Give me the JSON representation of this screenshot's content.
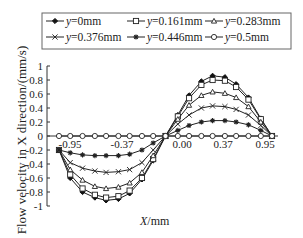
{
  "chart_data": {
    "type": "line",
    "title": "",
    "xlabel": "X/mm",
    "ylabel": "Flow velocity in X direction/(mm/s)",
    "ylim": [
      -1,
      1
    ],
    "xlim": [
      -0.95,
      0.95
    ],
    "yticks": [
      "1",
      "0.8",
      "0.6",
      "0.4",
      "0.2",
      "0",
      "-0.2",
      "-0.4",
      "-0.6",
      "-0.8",
      "-1"
    ],
    "xtick_labels": [
      "-0.95",
      "-0.37",
      "0.00",
      "0.37",
      "0.95"
    ],
    "grid": false,
    "legend_position": "top",
    "x": [
      -0.95,
      -0.85,
      -0.74,
      -0.63,
      -0.53,
      -0.42,
      -0.32,
      -0.21,
      -0.11,
      0.0,
      0.11,
      0.21,
      0.32,
      0.42,
      0.53,
      0.63,
      0.74,
      0.85,
      0.95
    ],
    "series": [
      {
        "name": "y=0mm",
        "marker": "filled-diamond",
        "values": [
          -0.2,
          -0.6,
          -0.8,
          -0.88,
          -0.92,
          -0.9,
          -0.82,
          -0.62,
          -0.35,
          0.0,
          0.3,
          0.58,
          0.78,
          0.86,
          0.84,
          0.74,
          0.55,
          0.25,
          0.0
        ]
      },
      {
        "name": "y=0.161mm",
        "marker": "open-square",
        "values": [
          -0.2,
          -0.55,
          -0.75,
          -0.84,
          -0.88,
          -0.86,
          -0.78,
          -0.6,
          -0.33,
          0.0,
          0.28,
          0.54,
          0.73,
          0.8,
          0.79,
          0.7,
          0.52,
          0.24,
          0.0
        ]
      },
      {
        "name": "y=0.283mm",
        "marker": "open-triangle",
        "values": [
          -0.2,
          -0.48,
          -0.63,
          -0.72,
          -0.75,
          -0.73,
          -0.67,
          -0.52,
          -0.28,
          0.0,
          0.24,
          0.44,
          0.58,
          0.63,
          0.61,
          0.55,
          0.42,
          0.2,
          0.0
        ]
      },
      {
        "name": "y=0.376mm",
        "marker": "x",
        "values": [
          -0.2,
          -0.38,
          -0.46,
          -0.5,
          -0.52,
          -0.51,
          -0.48,
          -0.38,
          -0.2,
          0.0,
          0.17,
          0.3,
          0.4,
          0.43,
          0.42,
          0.38,
          0.3,
          0.15,
          0.0
        ]
      },
      {
        "name": "y=0.446mm",
        "marker": "asterisk",
        "values": [
          -0.2,
          -0.24,
          -0.27,
          -0.28,
          -0.28,
          -0.28,
          -0.26,
          -0.2,
          -0.1,
          0.0,
          0.08,
          0.15,
          0.2,
          0.22,
          0.22,
          0.2,
          0.16,
          0.08,
          0.0
        ]
      },
      {
        "name": "y=0.5mm",
        "marker": "open-circle",
        "values": [
          0.0,
          0.0,
          0.0,
          0.0,
          0.0,
          0.0,
          0.0,
          0.0,
          0.0,
          0.0,
          0.0,
          0.0,
          0.0,
          0.0,
          0.0,
          0.0,
          0.0,
          0.0,
          0.0
        ]
      }
    ]
  },
  "legend": {
    "items": [
      {
        "label_var": "y",
        "label_rest": "=0mm"
      },
      {
        "label_var": "y",
        "label_rest": "=0.161mm"
      },
      {
        "label_var": "y",
        "label_rest": "=0.283mm"
      },
      {
        "label_var": "y",
        "label_rest": "=0.376mm"
      },
      {
        "label_var": "y",
        "label_rest": "=0.446mm"
      },
      {
        "label_var": "y",
        "label_rest": "=0.5mm"
      }
    ]
  },
  "axes": {
    "ylabel": "Flow velocity in X direction/(mm/s)",
    "xlabel_var": "X",
    "xlabel_rest": "/mm"
  }
}
